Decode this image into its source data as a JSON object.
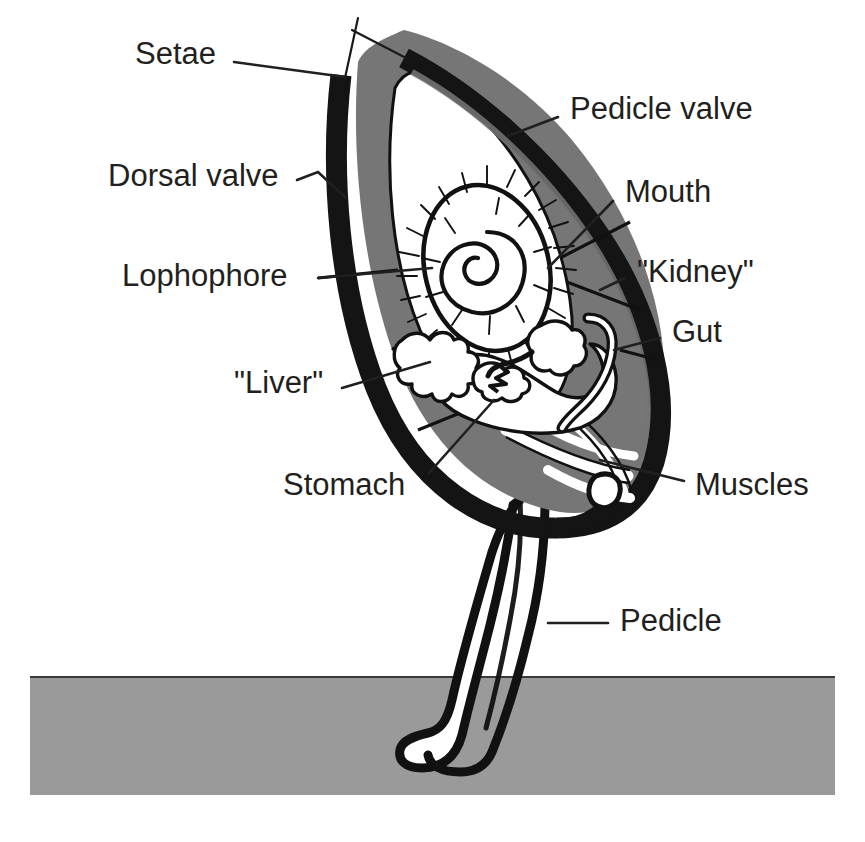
{
  "figure": {
    "organism": "brachiopod"
  },
  "colors": {
    "shell_black": "#141414",
    "mantle_gray": "#767676",
    "substrate_gray": "#9a9a9a",
    "body_white": "#ffffff",
    "label_text": "#231f20",
    "background": "#ffffff"
  },
  "labels": [
    {
      "id": "setae",
      "text": "Setae",
      "text_x": 135,
      "text_y": 56,
      "anchor": "start",
      "leader": "M 234 62 L 345 77"
    },
    {
      "id": "dorsal-valve",
      "text": "Dorsal valve",
      "text_x": 108,
      "text_y": 178,
      "anchor": "start",
      "leader": "M 297 180 L 316 173 L 345 196"
    },
    {
      "id": "lophophore",
      "text": "Lophophore",
      "text_x": 122,
      "text_y": 278,
      "anchor": "start",
      "leader": "M 318 278 L 500 264"
    },
    {
      "id": "liver",
      "text": "\"Liver\"",
      "text_x": 234,
      "text_y": 385,
      "anchor": "start",
      "leader": "M 342 388 L 472 368"
    },
    {
      "id": "stomach",
      "text": "Stomach",
      "text_x": 283,
      "text_y": 487,
      "anchor": "start",
      "leader": "M 429 473 L 492 399"
    },
    {
      "id": "pedicle-valve",
      "text": "Pedicle valve",
      "text_x": 570,
      "text_y": 111,
      "anchor": "start",
      "leader": "M 558 117 L 512 134"
    },
    {
      "id": "mouth",
      "text": "Mouth",
      "text_x": 625,
      "text_y": 194,
      "anchor": "start",
      "leader": "M 613 201 L 561 253"
    },
    {
      "id": "kidney",
      "text": "\"Kidney\"",
      "text_x": 637,
      "text_y": 274,
      "anchor": "start",
      "leader": "M 625 278 L 596 288"
    },
    {
      "id": "gut",
      "text": "Gut",
      "text_x": 672,
      "text_y": 334,
      "anchor": "start",
      "leader": "M 660 338 L 616 347"
    },
    {
      "id": "muscles",
      "text": "Muscles",
      "text_x": 695,
      "text_y": 487,
      "anchor": "start",
      "leader": "M 684 481 L 612 465"
    },
    {
      "id": "pedicle",
      "text": "Pedicle",
      "text_x": 620,
      "text_y": 623,
      "anchor": "start",
      "leader": "M 608 623 L 553 623"
    }
  ],
  "structures": {
    "pedicle_valve": "pedicle-valve-shell",
    "dorsal_valve": "dorsal-valve-shell",
    "mantle_cavity": "mantle-cavity-fill",
    "lophophore": "lophophore-spiral",
    "stomach": "stomach-body",
    "liver": "liver-lobes",
    "gut": "gut-loop",
    "kidney": "kidney-organ",
    "mouth": "mouth-point",
    "muscles": "muscle-bands",
    "pedicle_stalk": "pedicle-stalk",
    "substrate": "substrate-band",
    "setae_count": 2
  },
  "substrate": {
    "top_y": 676,
    "bottom_y": 795,
    "left_x": 30,
    "right_x": 835
  }
}
